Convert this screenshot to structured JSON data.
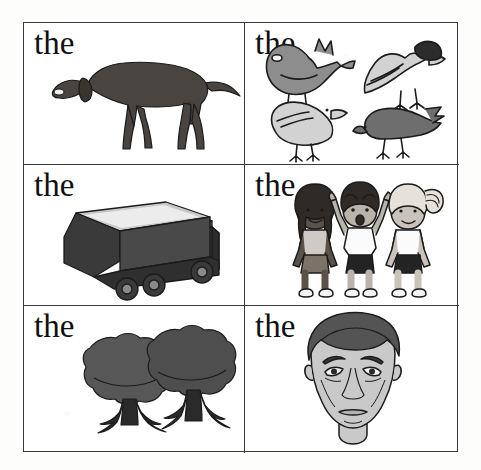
{
  "page": {
    "kind": "picture-word worksheet",
    "title": "the",
    "background_color": "#ffffff",
    "border_color": "#3a3a3a",
    "text_color": "#101010",
    "rows": 3,
    "columns": 2
  },
  "cells": [
    {
      "id": "cell-1",
      "word": "the",
      "illustration": "dog",
      "illustration_description": "dark brown dog standing in profile facing left with tail extended right",
      "fill_color": "#4a4440",
      "outline_color": "#1b1b1b",
      "count": 1
    },
    {
      "id": "cell-2",
      "word": "the",
      "illustration": "birds",
      "illustration_description": "four birds: gray pigeon upper left, pale cockatoo upper right, pale dove lower left, dark bird lower right",
      "fill_color": "#8d8d8d",
      "outline_color": "#1b1b1b",
      "count": 4
    },
    {
      "id": "cell-3",
      "word": "the",
      "illustration": "truck",
      "illustration_description": "dark dump truck with open cargo box seen from rear three-quarter view",
      "fill_color": "#4a4a4a",
      "outline_color": "#1b1b1b",
      "count": 1
    },
    {
      "id": "cell-4",
      "word": "the",
      "illustration": "children",
      "illustration_description": "three children standing: dark-skinned girl, boy with arms raised, blonde girl with ponytail",
      "fill_color": "#b5b5b5",
      "outline_color": "#1b1b1b",
      "count": 3
    },
    {
      "id": "cell-5",
      "word": "the",
      "illustration": "trees",
      "illustration_description": "two leafy trees with round dark canopies and dark trunks",
      "fill_color": "#575757",
      "outline_color": "#1b1b1b",
      "count": 2
    },
    {
      "id": "cell-6",
      "word": "the",
      "illustration": "face",
      "illustration_description": "front view of a man's face with dark hair and neutral expression",
      "fill_color": "#c9c9c9",
      "outline_color": "#1b1b1b",
      "count": 1
    }
  ]
}
